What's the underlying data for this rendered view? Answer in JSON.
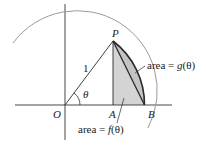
{
  "diagram": {
    "points": {
      "O": {
        "label": "O"
      },
      "P": {
        "label": "P"
      },
      "A": {
        "label": "A"
      },
      "B": {
        "label": "B"
      }
    },
    "radius_label": "1",
    "angle_label": "θ",
    "area_g": {
      "prefix": "area = ",
      "func": "g",
      "arg": "(θ)"
    },
    "area_f": {
      "prefix": "area = ",
      "func": "f",
      "arg": "(θ)"
    },
    "colors": {
      "shade": "#d4d4d4",
      "arc": "#9a9a9a",
      "line": "#2a2a2a",
      "axis": "#333333"
    }
  }
}
